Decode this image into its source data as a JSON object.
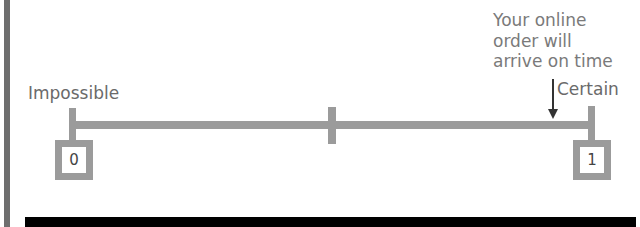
{
  "diagram": {
    "type": "probability-scale",
    "left_label": "Impossible",
    "right_label": "Certain",
    "start_value": "0",
    "end_value": "1",
    "annotation": {
      "lines": [
        "Your online",
        "order will",
        "arrive on time"
      ],
      "position_fraction": 0.93
    },
    "colors": {
      "scale": "#9b9b9b",
      "text": "#6a6a6a",
      "arrow": "#333333",
      "bottom_bar": "#000000"
    }
  }
}
